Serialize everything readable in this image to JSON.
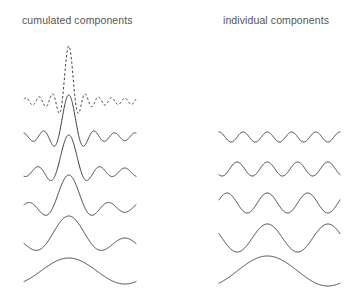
{
  "figure": {
    "width": 349,
    "height": 290,
    "background": "#ffffff",
    "stroke_color": "#3a3a3a",
    "text_color": "#555555"
  },
  "columns": {
    "left": {
      "title": "cumulated components",
      "title_x": 22,
      "title_y": 14,
      "x_start": 24,
      "x_end": 136
    },
    "right": {
      "title": "individual components",
      "title_x": 223,
      "title_y": 14,
      "x_start": 219,
      "x_end": 340
    }
  },
  "chart_data": {
    "type": "line",
    "xlabel": "",
    "ylabel": "",
    "grid": false,
    "legend": null,
    "x_domain": [
      0,
      1
    ],
    "series": [
      {
        "name": "cumulated-sum-all-dashed",
        "column": "left",
        "row": 0,
        "style": "dashed",
        "baseline_y": 98,
        "amplitude_px": 52,
        "harmonics": [
          1,
          2,
          3,
          4,
          5,
          6,
          7,
          8
        ],
        "weights": [
          1,
          1,
          1,
          1,
          1,
          1,
          1,
          1
        ],
        "peak_x": 68,
        "peak_y": 46,
        "comment": "total sum of all components, drawn dashed"
      },
      {
        "name": "cumulated-sum-5",
        "column": "left",
        "row": 1,
        "style": "solid",
        "baseline_y": 133,
        "amplitude_px": 38,
        "harmonics": [
          1,
          2,
          3,
          4,
          5
        ],
        "weights": [
          1,
          1,
          1,
          1,
          1
        ],
        "peak_x": 68,
        "peak_y": 113
      },
      {
        "name": "cumulated-sum-4",
        "column": "left",
        "row": 2,
        "style": "solid",
        "baseline_y": 168,
        "amplitude_px": 33,
        "harmonics": [
          1,
          2,
          3,
          4
        ],
        "weights": [
          1,
          1,
          1,
          1
        ],
        "peak_x": 68,
        "peak_y": 145
      },
      {
        "name": "cumulated-sum-3",
        "column": "left",
        "row": 3,
        "style": "solid",
        "baseline_y": 203,
        "amplitude_px": 28,
        "harmonics": [
          1,
          2,
          3
        ],
        "weights": [
          1,
          1,
          1
        ],
        "peak_x": 68,
        "peak_y": 180
      },
      {
        "name": "cumulated-sum-2",
        "column": "left",
        "row": 4,
        "style": "solid",
        "baseline_y": 238,
        "amplitude_px": 22,
        "harmonics": [
          1,
          2
        ],
        "weights": [
          1,
          1
        ],
        "peak_x": 68,
        "peak_y": 216
      },
      {
        "name": "cumulated-sum-1",
        "column": "left",
        "row": 5,
        "style": "solid",
        "baseline_y": 271,
        "amplitude_px": 13,
        "harmonics": [
          1
        ],
        "weights": [
          1
        ],
        "peak_x": 68,
        "peak_y": 259
      },
      {
        "name": "individual-component-5",
        "column": "right",
        "row": 1,
        "style": "solid",
        "baseline_y": 137,
        "amplitude_px": 5,
        "cycles": 5
      },
      {
        "name": "individual-component-4",
        "column": "right",
        "row": 2,
        "style": "solid",
        "baseline_y": 169,
        "amplitude_px": 7,
        "cycles": 4
      },
      {
        "name": "individual-component-3",
        "column": "right",
        "row": 3,
        "style": "solid",
        "baseline_y": 203,
        "amplitude_px": 10,
        "cycles": 3
      },
      {
        "name": "individual-component-2",
        "column": "right",
        "row": 4,
        "style": "solid",
        "baseline_y": 238,
        "amplitude_px": 14,
        "cycles": 2
      },
      {
        "name": "individual-component-1",
        "column": "right",
        "row": 5,
        "style": "solid",
        "baseline_y": 271,
        "amplitude_px": 15,
        "cycles": 1
      }
    ]
  }
}
